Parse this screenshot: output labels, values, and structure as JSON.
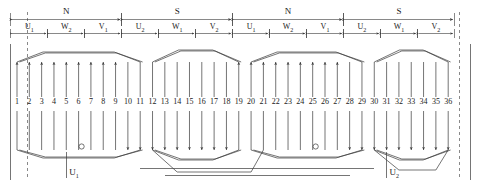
{
  "diagram": {
    "slot_count": 36,
    "pole_count": 4,
    "slots_per_pole_per_phase": 3,
    "line_color": "#3a3a3a"
  },
  "poles": [
    {
      "label": "N",
      "start_slot": 1,
      "end_slot": 9
    },
    {
      "label": "S",
      "start_slot": 10,
      "end_slot": 18
    },
    {
      "label": "N",
      "start_slot": 19,
      "end_slot": 27
    },
    {
      "label": "S",
      "start_slot": 28,
      "end_slot": 36
    }
  ],
  "phase_bands": [
    {
      "label": "U",
      "sub": "1",
      "start_slot": 1,
      "end_slot": 3
    },
    {
      "label": "W",
      "sub": "2",
      "start_slot": 4,
      "end_slot": 6
    },
    {
      "label": "V",
      "sub": "1",
      "start_slot": 7,
      "end_slot": 9
    },
    {
      "label": "U",
      "sub": "2",
      "start_slot": 10,
      "end_slot": 12
    },
    {
      "label": "W",
      "sub": "1",
      "start_slot": 13,
      "end_slot": 15
    },
    {
      "label": "V",
      "sub": "2",
      "start_slot": 16,
      "end_slot": 18
    },
    {
      "label": "U",
      "sub": "1",
      "start_slot": 19,
      "end_slot": 21
    },
    {
      "label": "W",
      "sub": "2",
      "start_slot": 22,
      "end_slot": 24
    },
    {
      "label": "V",
      "sub": "1",
      "start_slot": 25,
      "end_slot": 27
    },
    {
      "label": "U",
      "sub": "2",
      "start_slot": 28,
      "end_slot": 30
    },
    {
      "label": "W",
      "sub": "1",
      "start_slot": 31,
      "end_slot": 33
    },
    {
      "label": "V",
      "sub": "2",
      "start_slot": 34,
      "end_slot": 36
    }
  ],
  "slots": [
    {
      "n": 1,
      "label": "1",
      "current": "up"
    },
    {
      "n": 2,
      "label": "2",
      "current": "up"
    },
    {
      "n": 3,
      "label": "3",
      "current": "up"
    },
    {
      "n": 4,
      "label": "4",
      "current": "up"
    },
    {
      "n": 5,
      "label": "5",
      "current": "up"
    },
    {
      "n": 6,
      "label": "6",
      "current": "up"
    },
    {
      "n": 7,
      "label": "7",
      "current": "up"
    },
    {
      "n": 8,
      "label": "8",
      "current": "up"
    },
    {
      "n": 9,
      "label": "9",
      "current": "up"
    },
    {
      "n": 10,
      "label": "10",
      "current": "down"
    },
    {
      "n": 11,
      "label": "11",
      "current": "down"
    },
    {
      "n": 12,
      "label": "12",
      "current": "down"
    },
    {
      "n": 13,
      "label": "13",
      "current": "down"
    },
    {
      "n": 14,
      "label": "14",
      "current": "down"
    },
    {
      "n": 15,
      "label": "15",
      "current": "down"
    },
    {
      "n": 16,
      "label": "16",
      "current": "down"
    },
    {
      "n": 17,
      "label": "17",
      "current": "down"
    },
    {
      "n": 18,
      "label": "18",
      "current": "down"
    },
    {
      "n": 19,
      "label": "19",
      "current": "up"
    },
    {
      "n": 20,
      "label": "20",
      "current": "up"
    },
    {
      "n": 21,
      "label": "21",
      "current": "up"
    },
    {
      "n": 22,
      "label": "22",
      "current": "up"
    },
    {
      "n": 23,
      "label": "23",
      "current": "up"
    },
    {
      "n": 24,
      "label": "24",
      "current": "up"
    },
    {
      "n": 25,
      "label": "25",
      "current": "up"
    },
    {
      "n": 26,
      "label": "26",
      "current": "up"
    },
    {
      "n": 27,
      "label": "27",
      "current": "up"
    },
    {
      "n": 28,
      "label": "28",
      "current": "down"
    },
    {
      "n": 29,
      "label": "29",
      "current": "down"
    },
    {
      "n": 30,
      "label": "30",
      "current": "down"
    },
    {
      "n": 31,
      "label": "31",
      "current": "down"
    },
    {
      "n": 32,
      "label": "32",
      "current": "down"
    },
    {
      "n": 33,
      "label": "33",
      "current": "down"
    },
    {
      "n": 34,
      "label": "34",
      "current": "down"
    },
    {
      "n": 35,
      "label": "35",
      "current": "down"
    },
    {
      "n": 36,
      "label": "36",
      "current": "down"
    }
  ],
  "coil_groups": [
    {
      "name": "group-1",
      "first_slot": 1,
      "last_slot": 11,
      "shape": "hexagon"
    },
    {
      "name": "group-2",
      "first_slot": 12,
      "last_slot": 19,
      "shape": "hexagon"
    },
    {
      "name": "group-3",
      "first_slot": 20,
      "last_slot": 29,
      "shape": "hexagon"
    },
    {
      "name": "group-4",
      "first_slot": 30,
      "last_slot": 36,
      "shape": "hexagon"
    }
  ],
  "terminals": [
    {
      "id": "U1",
      "label": "U",
      "sub": "1",
      "near_slot": 5
    },
    {
      "id": "U2",
      "label": "U",
      "sub": "2",
      "near_slot": 31
    }
  ],
  "junction_nodes": [
    {
      "name": "junction-left",
      "near_slot": 6
    },
    {
      "name": "junction-right",
      "near_slot": 25
    }
  ]
}
